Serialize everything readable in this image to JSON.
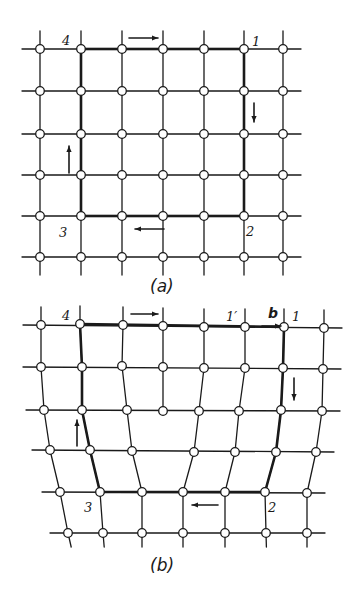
{
  "figure": {
    "panel_a": {
      "caption": "(a)",
      "corner_labels": {
        "c1": "1",
        "c2": "2",
        "c3": "3",
        "c4": "4"
      },
      "cols_x": [
        40,
        81,
        122,
        163,
        204,
        244,
        283
      ],
      "rows_y": [
        49,
        91,
        134,
        175,
        216,
        257
      ],
      "circuit": {
        "from_col": 1,
        "to_col": 5,
        "from_row": 0,
        "to_row": 4
      }
    },
    "panel_b": {
      "caption": "(b)",
      "corner_labels": {
        "c1": "1",
        "c1prime": "1′",
        "burgers": "b",
        "c2": "2",
        "c3": "3",
        "c4": "4"
      },
      "nodes": [
        [
          [
            41,
            325
          ],
          [
            80,
            324
          ],
          [
            123,
            325
          ],
          [
            163,
            326
          ],
          [
            204,
            327
          ],
          [
            245,
            327
          ],
          [
            284,
            327
          ],
          [
            324,
            328
          ]
        ],
        [
          [
            41,
            367
          ],
          [
            82,
            367
          ],
          [
            122,
            366
          ],
          [
            163,
            367
          ],
          [
            204,
            368
          ],
          [
            245,
            368
          ],
          [
            283,
            368
          ],
          [
            323,
            369
          ]
        ],
        [
          [
            44,
            410
          ],
          [
            82,
            410
          ],
          [
            127,
            410
          ],
          [
            163,
            411
          ],
          [
            199,
            411
          ],
          [
            239,
            411
          ],
          [
            281,
            410
          ],
          [
            322,
            411
          ]
        ],
        [
          [
            50,
            450
          ],
          [
            90,
            450
          ],
          [
            132,
            451
          ],
          [
            194,
            452
          ],
          [
            235,
            452
          ],
          [
            276,
            452
          ],
          [
            316,
            452
          ]
        ],
        [
          [
            60,
            492
          ],
          [
            100,
            492
          ],
          [
            142,
            492
          ],
          [
            183,
            492
          ],
          [
            225,
            492
          ],
          [
            265,
            492
          ],
          [
            307,
            493
          ]
        ],
        [
          [
            68,
            533
          ],
          [
            103,
            533
          ],
          [
            142,
            533
          ],
          [
            183,
            533
          ],
          [
            225,
            533
          ],
          [
            266,
            533
          ],
          [
            307,
            533
          ]
        ]
      ]
    },
    "colors": {
      "line": "#1a1a1a",
      "node_fill": "#ffffff",
      "background": "#ffffff"
    }
  }
}
